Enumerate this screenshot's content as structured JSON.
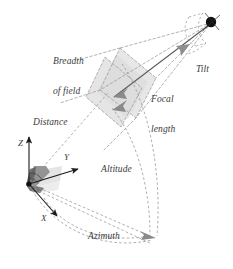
{
  "figure": {
    "type": "diagram",
    "background_color": "#ffffff",
    "line_color": "#8c8c8c",
    "solid_line_color": "#5a5a5a",
    "axis_color": "#1a1a1a",
    "label_color": "#3b3b3b",
    "camera_point_color": "#111111",
    "plane_fill_color": "#e2e2e2",
    "cone_fill_color": "#6e6e6e",
    "arrow_fill_color": "#7f7f7f"
  },
  "labels": {
    "breadth_of_field_line1": "Breadth",
    "breadth_of_field_line2": "of field",
    "focal_length_line1": "Focal",
    "focal_length_line2": "length",
    "tilt": "Tilt",
    "distance": "Distance",
    "altitude": "Altitude",
    "azimuth": "Azimuth",
    "axis_x": "X",
    "axis_y": "Y",
    "axis_z": "Z"
  },
  "elements": {
    "camera_point": "camera-eye-point",
    "image_plane_front": "image-plane-front",
    "image_plane_back": "image-plane-back",
    "origin_cone": "origin-view-cone",
    "origin_plane": "origin-ground-plane",
    "focal_arrow_upper": "focal-length-arrow-upper",
    "focal_arrow_lower": "focal-length-arrow-lower",
    "tilt_arrow": "tilt-direction-arrow",
    "azimuth_arrow": "azimuth-direction-arrow",
    "altitude_arc": "altitude-arc",
    "azimuth_arc": "azimuth-arc",
    "distance_line": "distance-line",
    "frustum": "view-frustum-lines",
    "tilt_arc": "tilt-arc"
  }
}
